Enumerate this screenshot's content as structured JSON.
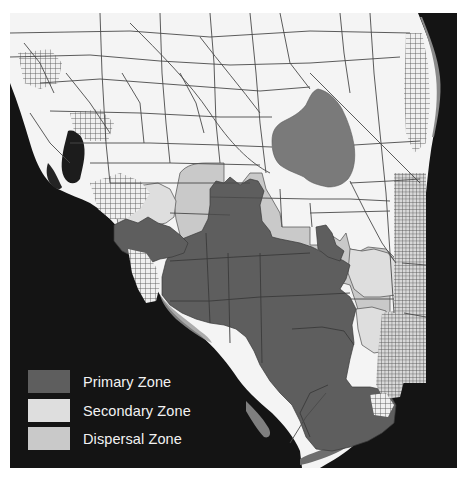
{
  "map": {
    "region": "South Florida",
    "colors": {
      "ocean": "#141414",
      "land": "#f4f4f4",
      "roads": "#4a4a4a",
      "lake": "#7a7a7a",
      "primary": "#5e5e5e",
      "secondary": "#dedede",
      "dispersal": "#c9c9c9",
      "urban_grid": "#6a6a6a"
    }
  },
  "legend": {
    "items": [
      {
        "label": "Primary Zone",
        "color": "#5e5e5e"
      },
      {
        "label": "Secondary Zone",
        "color": "#dedede"
      },
      {
        "label": "Dispersal Zone",
        "color": "#c9c9c9"
      }
    ]
  }
}
